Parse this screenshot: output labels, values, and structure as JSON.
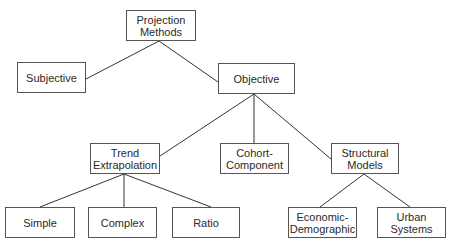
{
  "diagram": {
    "type": "tree",
    "nodes": [
      {
        "id": "projection",
        "lines": [
          "Projection",
          "Methods"
        ],
        "box": [
          126,
          10,
          70,
          31
        ]
      },
      {
        "id": "subjective",
        "lines": [
          "Subjective"
        ],
        "box": [
          17,
          62,
          69,
          31
        ]
      },
      {
        "id": "objective",
        "lines": [
          "Objective"
        ],
        "box": [
          218,
          63,
          77,
          31
        ]
      },
      {
        "id": "trend",
        "lines": [
          "Trend",
          "Extrapolation"
        ],
        "box": [
          90,
          143,
          70,
          31
        ]
      },
      {
        "id": "cohort",
        "lines": [
          "Cohort-",
          "Component"
        ],
        "box": [
          220,
          143,
          69,
          31
        ]
      },
      {
        "id": "structural",
        "lines": [
          "Structural",
          "Models"
        ],
        "box": [
          331,
          143,
          68,
          31
        ]
      },
      {
        "id": "simple",
        "lines": [
          "Simple"
        ],
        "box": [
          5,
          207,
          70,
          31
        ]
      },
      {
        "id": "complex",
        "lines": [
          "Complex"
        ],
        "box": [
          88,
          207,
          69,
          31
        ]
      },
      {
        "id": "ratio",
        "lines": [
          "Ratio"
        ],
        "box": [
          172,
          207,
          68,
          31
        ]
      },
      {
        "id": "econdemo",
        "lines": [
          "Economic-",
          "Demographic"
        ],
        "box": [
          288,
          207,
          69,
          31
        ]
      },
      {
        "id": "urban",
        "lines": [
          "Urban",
          "Systems"
        ],
        "box": [
          377,
          207,
          69,
          31
        ]
      }
    ],
    "edges": [
      {
        "from": "projection",
        "to": "subjective",
        "line": [
          159,
          41,
          86,
          79
        ]
      },
      {
        "from": "projection",
        "to": "objective",
        "line": [
          159,
          41,
          218,
          82
        ]
      },
      {
        "from": "objective",
        "to": "trend",
        "line": [
          254,
          94,
          160,
          156
        ]
      },
      {
        "from": "objective",
        "to": "cohort",
        "line": [
          254,
          94,
          254,
          143
        ]
      },
      {
        "from": "objective",
        "to": "structural",
        "line": [
          254,
          94,
          331,
          159
        ]
      },
      {
        "from": "trend",
        "to": "simple",
        "line": [
          124,
          174,
          40,
          207
        ]
      },
      {
        "from": "trend",
        "to": "complex",
        "line": [
          124,
          174,
          124,
          207
        ]
      },
      {
        "from": "trend",
        "to": "ratio",
        "line": [
          124,
          174,
          211,
          207
        ]
      },
      {
        "from": "structural",
        "to": "econdemo",
        "line": [
          364,
          174,
          320,
          207
        ]
      },
      {
        "from": "structural",
        "to": "urban",
        "line": [
          364,
          174,
          410,
          207
        ]
      }
    ]
  }
}
